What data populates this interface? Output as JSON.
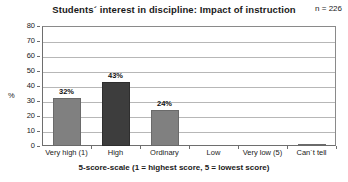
{
  "chart_data": {
    "type": "bar",
    "title": "Students´ interest in discipline: Impact of instruction",
    "xlabel": "5-score-scale (1 = highest score, 5 = lowest score)",
    "ylabel": "%",
    "ylim": [
      0,
      80
    ],
    "yticks": [
      0,
      10,
      20,
      30,
      40,
      50,
      60,
      70,
      80
    ],
    "ytick_labels": [
      "0",
      "10",
      "20",
      "30",
      "40",
      "50",
      "60",
      "70",
      "80"
    ],
    "grid": true,
    "legend": "none",
    "categories": [
      "Very high (1)",
      "High",
      "Ordinary",
      "Low",
      "Very low (5)",
      "Can´t tell"
    ],
    "values": [
      32,
      43,
      24,
      0,
      0,
      1.5
    ],
    "value_labels": [
      "32%",
      "43%",
      "24%",
      "",
      "",
      ""
    ],
    "bar_colors": [
      "#808080",
      "#3d3d3d",
      "#808080",
      "#808080",
      "#808080",
      "#808080"
    ],
    "annotations": [
      {
        "name": "sample-size",
        "text": "n = 226"
      }
    ]
  },
  "colors": {
    "bar_default": "#808080",
    "bar_highlight": "#3d3d3d",
    "gridline": "#b7b7b7",
    "axis": "#6e6e6e",
    "text": "#1a1a1a",
    "background": "#ffffff"
  }
}
